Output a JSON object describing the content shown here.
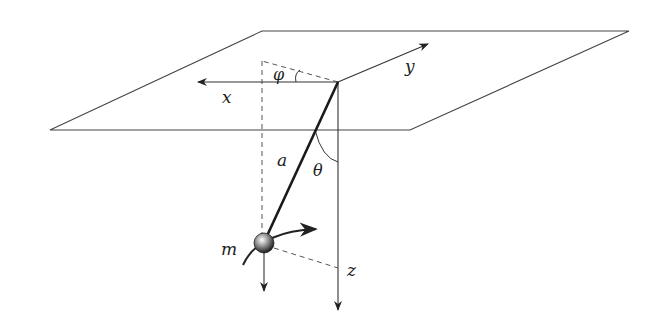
{
  "diagram": {
    "labels": {
      "x_axis": "x",
      "y_axis": "y",
      "z_axis": "z",
      "phi": "φ",
      "theta": "θ",
      "length": "a",
      "mass": "m"
    },
    "colors": {
      "stroke": "#333333",
      "rod": "#1a1a1a",
      "dashed": "#555555",
      "background": "#ffffff"
    }
  }
}
